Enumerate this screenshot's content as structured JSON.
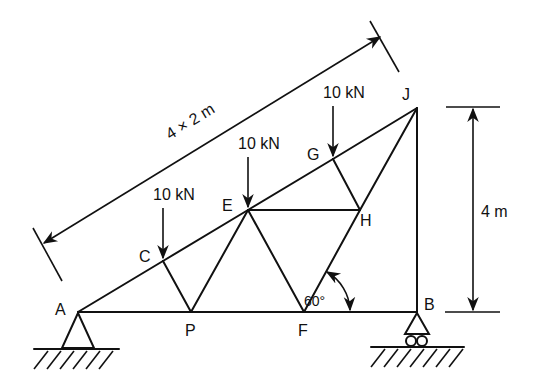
{
  "figure": {
    "type": "truss",
    "nodes": {
      "A": {
        "label": "A",
        "x": 78,
        "y": 312
      },
      "P": {
        "label": "P",
        "x": 191,
        "y": 312
      },
      "F": {
        "label": "F",
        "x": 304,
        "y": 312
      },
      "B": {
        "label": "B",
        "x": 417,
        "y": 312
      },
      "C": {
        "label": "C",
        "x": 163,
        "y": 261
      },
      "E": {
        "label": "E",
        "x": 248,
        "y": 210
      },
      "G": {
        "label": "G",
        "x": 333,
        "y": 159
      },
      "J": {
        "label": "J",
        "x": 417,
        "y": 108
      },
      "H": {
        "label": "H",
        "x": 360,
        "y": 210
      }
    },
    "members": [
      [
        "A",
        "C"
      ],
      [
        "C",
        "E"
      ],
      [
        "E",
        "G"
      ],
      [
        "G",
        "J"
      ],
      [
        "A",
        "P"
      ],
      [
        "P",
        "F"
      ],
      [
        "F",
        "B"
      ],
      [
        "J",
        "B"
      ],
      [
        "C",
        "P"
      ],
      [
        "P",
        "E"
      ],
      [
        "E",
        "F"
      ],
      [
        "F",
        "H"
      ],
      [
        "H",
        "J"
      ],
      [
        "E",
        "H"
      ],
      [
        "G",
        "H"
      ]
    ],
    "loads": [
      {
        "node": "C",
        "label": "10 kN"
      },
      {
        "node": "E",
        "label": "10 kN"
      },
      {
        "node": "G",
        "label": "10 kN"
      }
    ],
    "supports": [
      {
        "node": "A",
        "type": "pin"
      },
      {
        "node": "B",
        "type": "roller"
      }
    ],
    "dimensions": {
      "top_chord": "4 × 2 m",
      "height": "4 m",
      "angle": "60°"
    }
  }
}
